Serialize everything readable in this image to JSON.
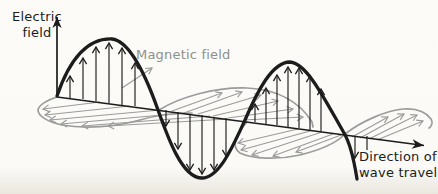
{
  "labels": {
    "electric_field": {
      "line1": "Electric",
      "line2": "field"
    },
    "magnetic_field": {
      "text": "Magnetic field"
    },
    "direction": {
      "line1": "Direction of",
      "line2": "wave travel"
    }
  },
  "colors": {
    "ink": "#1c1c1c",
    "gray": "#9b9b9b",
    "gray_text": "#8f8f8f",
    "background": "#fbfaf7"
  },
  "diagram": {
    "type": "electromagnetic-wave",
    "electric_wave_color": "#1c1c1c",
    "magnetic_wave_color": "#9b9b9b",
    "e_field_arrows_up_first_crest": 6,
    "e_field_arrows_down_trough": 6,
    "e_field_arrows_up_second_crest": 7,
    "e_field_arrows_down_after_second_crest": 2,
    "b_field_lobes": 4,
    "axis_arrows": [
      "electric-field-axis-up",
      "wave-travel-axis-right"
    ]
  }
}
